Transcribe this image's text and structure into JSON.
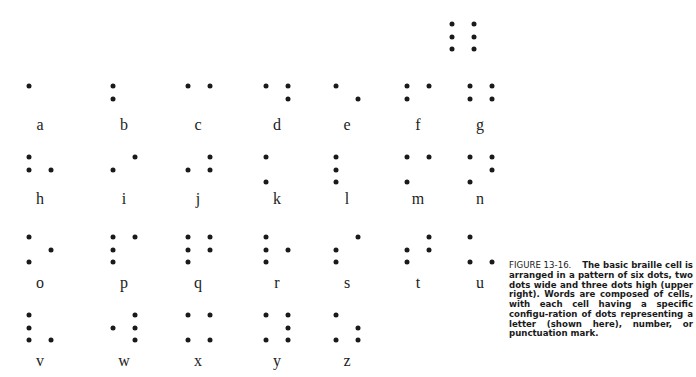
{
  "figure": {
    "reference_cell": {
      "label": "",
      "dots": [
        1,
        2,
        3,
        4,
        5,
        6
      ]
    },
    "letters": [
      {
        "char": "a",
        "dots": [
          1
        ]
      },
      {
        "char": "b",
        "dots": [
          1,
          2
        ]
      },
      {
        "char": "c",
        "dots": [
          1,
          4
        ]
      },
      {
        "char": "d",
        "dots": [
          1,
          4,
          5
        ]
      },
      {
        "char": "e",
        "dots": [
          1,
          5
        ]
      },
      {
        "char": "f",
        "dots": [
          1,
          2,
          4
        ]
      },
      {
        "char": "g",
        "dots": [
          1,
          2,
          4,
          5
        ]
      },
      {
        "char": "h",
        "dots": [
          1,
          2,
          5
        ]
      },
      {
        "char": "i",
        "dots": [
          2,
          4
        ]
      },
      {
        "char": "j",
        "dots": [
          2,
          4,
          5
        ]
      },
      {
        "char": "k",
        "dots": [
          1,
          3
        ]
      },
      {
        "char": "l",
        "dots": [
          1,
          2,
          3
        ]
      },
      {
        "char": "m",
        "dots": [
          1,
          3,
          4
        ]
      },
      {
        "char": "n",
        "dots": [
          1,
          3,
          4,
          5
        ]
      },
      {
        "char": "o",
        "dots": [
          1,
          3,
          5
        ]
      },
      {
        "char": "p",
        "dots": [
          1,
          2,
          3,
          4
        ]
      },
      {
        "char": "q",
        "dots": [
          1,
          2,
          3,
          4,
          5
        ]
      },
      {
        "char": "r",
        "dots": [
          1,
          2,
          3,
          5
        ]
      },
      {
        "char": "s",
        "dots": [
          2,
          3,
          4
        ]
      },
      {
        "char": "t",
        "dots": [
          2,
          3,
          4,
          5
        ]
      },
      {
        "char": "u",
        "dots": [
          1,
          3,
          6
        ]
      },
      {
        "char": "v",
        "dots": [
          1,
          2,
          3,
          6
        ]
      },
      {
        "char": "w",
        "dots": [
          2,
          4,
          5,
          6
        ]
      },
      {
        "char": "x",
        "dots": [
          1,
          3,
          4,
          6
        ]
      },
      {
        "char": "y",
        "dots": [
          1,
          3,
          4,
          5,
          6
        ]
      },
      {
        "char": "z",
        "dots": [
          1,
          3,
          5,
          6
        ]
      }
    ],
    "caption": {
      "figure_number": "FIGURE 13-16.",
      "text": "The basic braille cell is arranged in a pattern of six dots, two dots wide and three dots high (upper right). Words are composed of cells, with each cell having a specific configu-ration of dots representing a letter (shown here), number, or punctuation mark."
    }
  },
  "layout": {
    "columns_left_dot_x": [
      29,
      113,
      188,
      266,
      336,
      407,
      470
    ],
    "column_label_x": [
      40,
      124,
      198,
      277,
      347,
      418,
      480
    ],
    "dot_dx": 21.5,
    "dot_dy": 12.5,
    "rows_top_dot_y": [
      86,
      157,
      237,
      315
    ],
    "rows_label_y": [
      125,
      199,
      283,
      361
    ],
    "reference_cell_origin": [
      452,
      24
    ],
    "dot_color": "#1a1a1a"
  }
}
